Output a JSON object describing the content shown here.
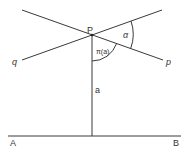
{
  "diagram": {
    "type": "hyperbolic-angle-of-parallelism",
    "colors": {
      "stroke": "#3a3a3a",
      "text": "#333333",
      "background": "#ffffff"
    },
    "labels": {
      "point_P": "P",
      "line_q": "q",
      "line_p": "p",
      "angle_alpha": "α",
      "angle_pi_a": "π(a)",
      "segment_a": "a",
      "point_A": "A",
      "point_B": "B"
    }
  }
}
